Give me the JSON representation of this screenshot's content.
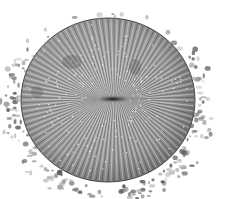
{
  "image": {
    "subject": "mushroom coral illustration",
    "description": "Grayscale engraving of a round mushroom coral disc with radiating septa and a central slit, resting on stippled gravel",
    "colors": {
      "background": "#ffffff",
      "disc_base": "#a8a8a8",
      "septa_dark": "#3a3a3a",
      "septa_light": "#e6e6e6",
      "mouth": "#1a1a1a",
      "gravel": "#8c8c8c"
    }
  }
}
